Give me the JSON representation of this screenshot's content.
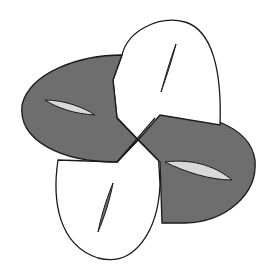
{
  "figure": {
    "colors": {
      "background": "#ffffff",
      "shaded_band": "#6e6e6e",
      "white_band": "#ffffff",
      "hole": "#d9d9d9",
      "outline": "#1a1a1a"
    },
    "caption": ""
  }
}
